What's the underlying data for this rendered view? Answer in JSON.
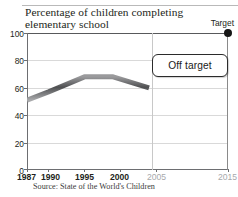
{
  "chart_data": {
    "type": "line",
    "title": "Percentage of children completing elementary school",
    "title_line1": "Percentage of children completing",
    "title_line2": "elementary school",
    "xlabel": "",
    "ylabel": "",
    "xlim": [
      1987,
      2015
    ],
    "ylim": [
      0,
      100
    ],
    "grid": true,
    "legend": "none",
    "source": "Source: State of the World's Children",
    "y_ticks": [
      "0",
      "20",
      "40",
      "60",
      "80",
      "100"
    ],
    "y_tick_values": [
      0,
      20,
      40,
      60,
      80,
      100
    ],
    "x_ticks": [
      {
        "label": "1987",
        "value": 1987,
        "muted": false
      },
      {
        "label": "1990",
        "value": 1990,
        "muted": false
      },
      {
        "label": "1995",
        "value": 1995,
        "muted": false
      },
      {
        "label": "2000",
        "value": 2000,
        "muted": false
      },
      {
        "label": "2005",
        "value": 2005,
        "muted": true
      },
      {
        "label": "2015",
        "value": 2015,
        "muted": true
      }
    ],
    "series": [
      {
        "name": "Percentage of children completing elementary school",
        "color": "#6d6e71",
        "x": [
          1987,
          1990,
          1995,
          1999,
          2004
        ],
        "values": [
          51,
          57,
          68,
          68,
          60
        ]
      }
    ],
    "target_point": {
      "label": "Target",
      "x": 2015,
      "value": 100,
      "color": "#161616"
    },
    "annotations": [
      {
        "name": "status-callout",
        "text": "Off target",
        "x": 2005,
        "y": 84
      }
    ]
  },
  "callout": {
    "status_label": "Off target"
  },
  "target": {
    "label": "Target"
  },
  "footer": {
    "source": "Source: State of the World's Children"
  }
}
